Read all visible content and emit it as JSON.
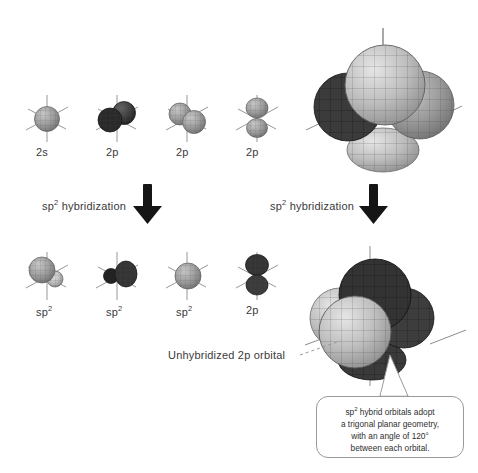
{
  "figure": {
    "background_color": "#ffffff",
    "text_color": "#3a3a3a"
  },
  "top_row": {
    "labels": [
      {
        "id": "2s",
        "text_main": "2s",
        "superscript": "",
        "orbital": "sphere",
        "shade": "light"
      },
      {
        "id": "2px",
        "text_main": "2p",
        "superscript": "",
        "orbital": "dumbbell-x",
        "shade": "dark"
      },
      {
        "id": "2py",
        "text_main": "2p",
        "superscript": "",
        "orbital": "dumbbell-y",
        "shade": "light"
      },
      {
        "id": "2pz",
        "text_main": "2p",
        "superscript": "",
        "orbital": "dumbbell-z",
        "shade": "light"
      }
    ]
  },
  "bottom_row": {
    "labels": [
      {
        "id": "sp2-a",
        "text_main": "sp",
        "superscript": "2",
        "orbital": "hybrid-a",
        "shade": "light"
      },
      {
        "id": "sp2-b",
        "text_main": "sp",
        "superscript": "2",
        "orbital": "hybrid-b",
        "shade": "dark"
      },
      {
        "id": "sp2-c",
        "text_main": "sp",
        "superscript": "2",
        "orbital": "sphere",
        "shade": "light"
      },
      {
        "id": "2p",
        "text_main": "2p",
        "superscript": "",
        "orbital": "dumbbell-z",
        "shade": "dark"
      }
    ]
  },
  "arrows": {
    "left": {
      "label_main": "sp",
      "label_sup": "2",
      "label_tail": " hybridization",
      "direction": "down"
    },
    "right": {
      "label_main": "sp",
      "label_sup": "2",
      "label_tail": " hybridization",
      "direction": "down"
    }
  },
  "composites": {
    "top_right": {
      "name": "unhybridized-orbital-set",
      "lobe_count": 4
    },
    "bottom_right": {
      "name": "sp2-hybrid-orbital-set",
      "lobe_count": 4
    }
  },
  "annotations": {
    "unhybridized": "Unhybridized 2p orbital",
    "callout": {
      "line1_main": "sp",
      "line1_sup": "2",
      "line1_tail": " hybrid orbitals adopt",
      "line2": "a trigonal planar geometry,",
      "line3": "with an angle of 120°",
      "line4": "between each orbital."
    }
  },
  "colors": {
    "dark_lobe": "#3a3a3a",
    "light_lobe": "#b9b9b9",
    "mid_lobe": "#8e8e8e",
    "axis": "#8c8c8c",
    "arrow": "#1a1a1a",
    "callout_border": "#9a9a9a",
    "leader_line": "#8c8c8c"
  }
}
